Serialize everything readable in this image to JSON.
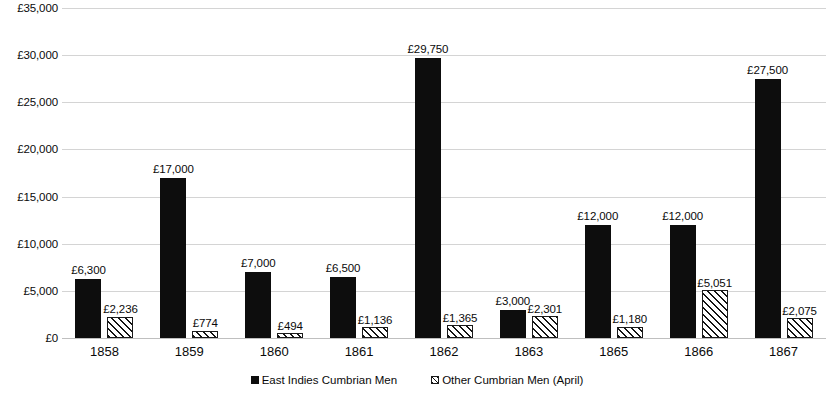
{
  "chart_data": {
    "type": "bar",
    "title": "",
    "subtitle": "",
    "xlabel": "",
    "ylabel": "",
    "categories": [
      "1858",
      "1859",
      "1860",
      "1861",
      "1862",
      "1863",
      "1865",
      "1866",
      "1867"
    ],
    "series": [
      {
        "name": "East Indies Cumbrian Men",
        "fill": "solid-black",
        "color": "#0d0d0d",
        "values": [
          6300,
          17000,
          7000,
          6500,
          29750,
          3000,
          12000,
          12000,
          27500
        ],
        "labels": [
          "£6,300",
          "£17,000",
          "£7,000",
          "£6,500",
          "£29,750",
          "£3,000",
          "£12,000",
          "£12,000",
          "£27,500"
        ]
      },
      {
        "name": "Other Cumbrian Men (April)",
        "fill": "diagonal-hatch",
        "color": "#141414",
        "values": [
          2236,
          774,
          494,
          1136,
          1365,
          2301,
          1180,
          5051,
          2075
        ],
        "labels": [
          "£2,236",
          "£774",
          "£494",
          "£1,136",
          "£1,365",
          "£2,301",
          "£1,180",
          "£5,051",
          "£2,075"
        ]
      }
    ],
    "ylim": [
      0,
      35000
    ],
    "ytick_values": [
      0,
      5000,
      10000,
      15000,
      20000,
      25000,
      30000,
      35000
    ],
    "ytick_labels": [
      "£0",
      "£5,000",
      "£10,000",
      "£15,000",
      "£20,000",
      "£25,000",
      "£30,000",
      "£35,000"
    ],
    "grid": "horizontal",
    "legend_position": "bottom",
    "data_labels": true
  },
  "legend": {
    "items": [
      {
        "label": "East Indies Cumbrian Men",
        "swatch": "solid"
      },
      {
        "label": "Other Cumbrian Men (April)",
        "swatch": "hatch"
      }
    ]
  }
}
